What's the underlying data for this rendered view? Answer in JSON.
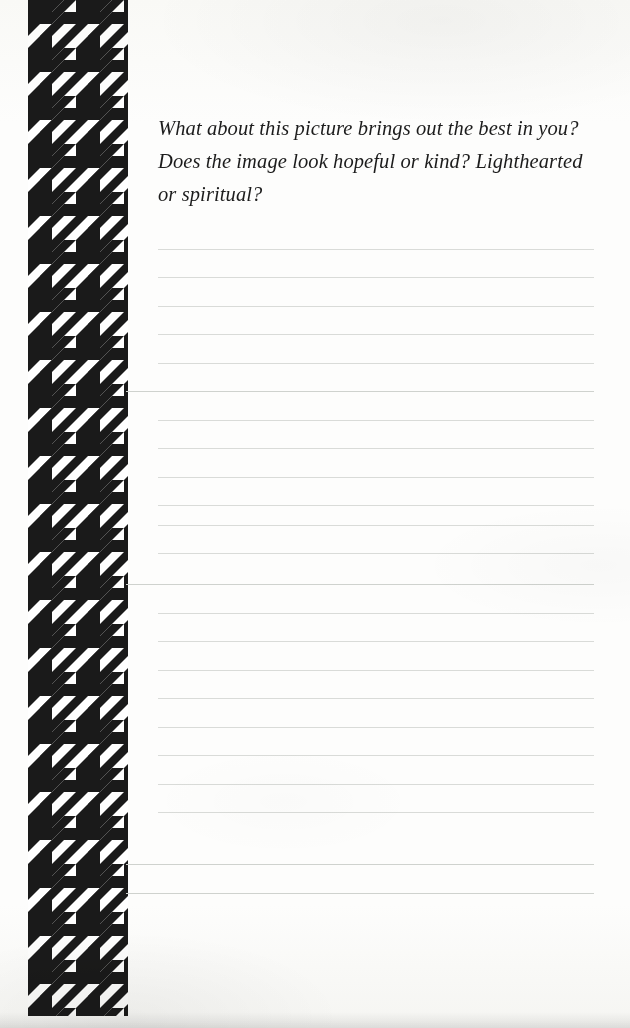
{
  "page": {
    "kind": "guided-journal-page",
    "background_color": "#fdfdfc",
    "width": 630,
    "height": 1028
  },
  "prompt": {
    "text": "What about this picture brings out the best in you? Does the image look hopeful or kind? Lighthearted or spiritual?",
    "style": "italic-serif",
    "color": "#1c1c1c"
  },
  "decoration": {
    "name": "houndstooth-border",
    "pattern": "houndstooth",
    "ink_color": "#1a1a1a",
    "paper_color": "#ffffff",
    "tile_size_px": 49,
    "band_left_px": 28,
    "band_width_px": 100,
    "band_top_px": 0,
    "band_height_px": 1016
  },
  "writing_area": {
    "name": "ruled-writing-lines",
    "line_color": "#d9dbd8",
    "line_spacing_px": 28.5,
    "first_line_y": 249,
    "line_count": 23,
    "short_line_left_px": 158,
    "long_line_left_px": 126,
    "line_right_px": 594,
    "long_line_indices": [
      5,
      12,
      21,
      22
    ],
    "lines": [
      {
        "y": 249,
        "variant": "short"
      },
      {
        "y": 277,
        "variant": "short"
      },
      {
        "y": 306,
        "variant": "short"
      },
      {
        "y": 334,
        "variant": "short"
      },
      {
        "y": 363,
        "variant": "short"
      },
      {
        "y": 391,
        "variant": "long"
      },
      {
        "y": 420,
        "variant": "short"
      },
      {
        "y": 448,
        "variant": "short"
      },
      {
        "y": 477,
        "variant": "short"
      },
      {
        "y": 505,
        "variant": "short"
      },
      {
        "y": 525,
        "variant": "short"
      },
      {
        "y": 553,
        "variant": "short"
      },
      {
        "y": 584,
        "variant": "long"
      },
      {
        "y": 613,
        "variant": "short"
      },
      {
        "y": 641,
        "variant": "short"
      },
      {
        "y": 670,
        "variant": "short"
      },
      {
        "y": 698,
        "variant": "short"
      },
      {
        "y": 727,
        "variant": "short"
      },
      {
        "y": 755,
        "variant": "short"
      },
      {
        "y": 784,
        "variant": "short"
      },
      {
        "y": 812,
        "variant": "short"
      },
      {
        "y": 864,
        "variant": "long"
      },
      {
        "y": 893,
        "variant": "long"
      }
    ]
  }
}
